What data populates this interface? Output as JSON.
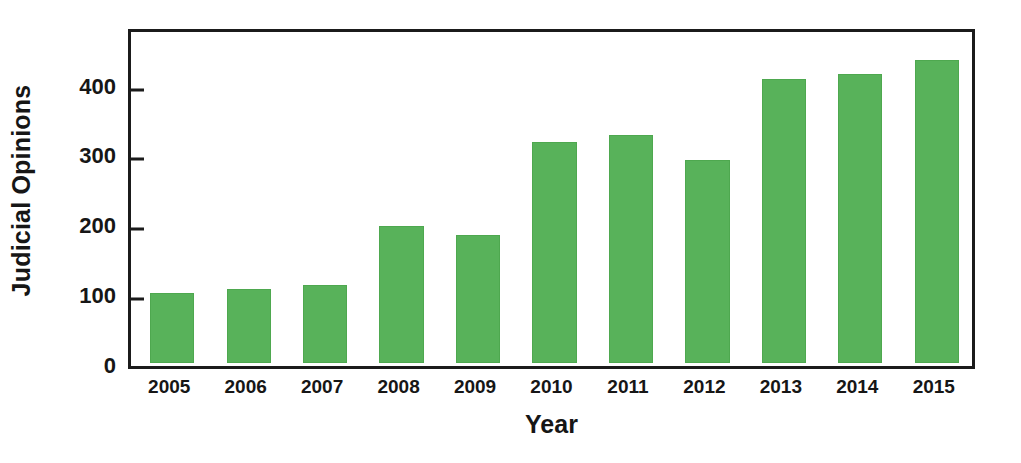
{
  "chart_data": {
    "type": "bar",
    "title": "",
    "xlabel": "Year",
    "ylabel": "Judicial Opinions",
    "categories": [
      "2005",
      "2006",
      "2007",
      "2008",
      "2009",
      "2010",
      "2011",
      "2012",
      "2013",
      "2014",
      "2015"
    ],
    "values": [
      100,
      106,
      111,
      196,
      183,
      317,
      327,
      291,
      406,
      414,
      433
    ],
    "series": [
      {
        "name": "Judicial Opinions",
        "values": [
          100,
          106,
          111,
          196,
          183,
          317,
          327,
          291,
          406,
          414,
          433
        ],
        "color": "#58b25a"
      }
    ],
    "ylim": [
      0,
      478
    ],
    "yticks": [
      0,
      100,
      200,
      300,
      400
    ],
    "ytick_labels": [
      "0",
      "100",
      "200",
      "300",
      "400"
    ],
    "grid": false,
    "legend": false,
    "legend_position": "none",
    "bar_color": "#58b25a",
    "axis_color": "#1b1b1b",
    "text_color": "#161616",
    "background": "#ffffff"
  }
}
